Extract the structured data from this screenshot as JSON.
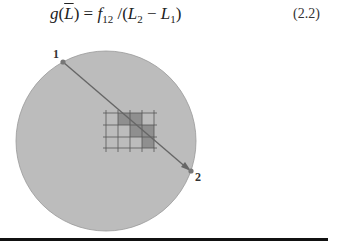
{
  "equation": {
    "lhs_func": "g",
    "lhs_arg": "L",
    "equals": "=",
    "f": "f",
    "f_sub": "12",
    "slash": "/",
    "l2": "L",
    "l2_sub": "2",
    "minus": "−",
    "l1": "L",
    "l1_sub": "1",
    "number": "(2.2)"
  },
  "figure": {
    "point_labels": [
      "1",
      "2"
    ],
    "circle_fill": "#b9b9b9",
    "cell_fill": "#8f8f8f",
    "line_color": "#555555"
  }
}
